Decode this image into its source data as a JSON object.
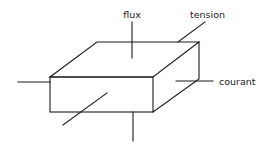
{
  "diagram": {
    "type": "3d-box-with-terminals",
    "stroke_color": "#1a1a1a",
    "background": "#ffffff",
    "labels": {
      "flux": "flux",
      "tension": "tension",
      "courant": "courant"
    },
    "box": {
      "top_face": [
        [
          97,
          42
        ],
        [
          199,
          42
        ],
        [
          153,
          77
        ],
        [
          50,
          77
        ]
      ],
      "front_face": [
        [
          50,
          77
        ],
        [
          153,
          77
        ],
        [
          153,
          112
        ],
        [
          50,
          112
        ]
      ],
      "right_face": [
        [
          153,
          77
        ],
        [
          199,
          42
        ],
        [
          199,
          79
        ],
        [
          153,
          112
        ]
      ]
    },
    "terminals": [
      {
        "name": "flux",
        "from": [
          132,
          22
        ],
        "to": [
          132,
          58
        ]
      },
      {
        "name": "tension",
        "from": [
          178,
          42
        ],
        "to": [
          205,
          22
        ]
      },
      {
        "name": "courant",
        "from": [
          176,
          81
        ],
        "to": [
          213,
          81
        ]
      },
      {
        "name": "left",
        "from": [
          18,
          82
        ],
        "to": [
          50,
          82
        ]
      },
      {
        "name": "front-diagonal",
        "from": [
          63,
          125
        ],
        "to": [
          107,
          93
        ]
      },
      {
        "name": "bottom",
        "from": [
          133,
          112
        ],
        "to": [
          133,
          141
        ]
      }
    ]
  }
}
